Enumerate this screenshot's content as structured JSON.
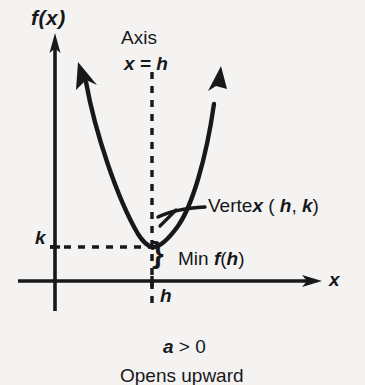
{
  "figure": {
    "title_implicit": "Parabola opening upward with vertex (h, k)",
    "background_color": "#f4f3f1",
    "ink_color": "#17181a",
    "labels": {
      "y_axis": "f(x)",
      "x_axis": "x",
      "axis_of_symmetry": "Axis",
      "axis_equation": "x = h",
      "k_tick": "k",
      "h_tick": "h",
      "vertex": "Vertex ( h, k)",
      "minimum": "Min  f(h)",
      "brace": "}",
      "coefficient_condition": "a > 0",
      "direction": "Opens upward"
    }
  },
  "chart_data": {
    "type": "line",
    "title": "",
    "subtitle": "",
    "xlabel": "x",
    "ylabel": "f(x)",
    "xlim": [
      0,
      1
    ],
    "ylim": [
      0,
      1
    ],
    "grid": false,
    "legend": null,
    "series": [
      {
        "name": "parabola",
        "shape": "upward parabola",
        "vertex": {
          "x": "h",
          "y": "k"
        },
        "opens": "upward",
        "leading_coefficient_sign": "a > 0",
        "left_branch_arrow": true,
        "right_branch_arrow": true
      },
      {
        "name": "axis-of-symmetry",
        "style": "dashed",
        "equation": "x = h",
        "orientation": "vertical"
      },
      {
        "name": "k-level-line",
        "style": "dashed",
        "equation": "f(x) = k",
        "orientation": "horizontal"
      }
    ],
    "annotations": [
      {
        "text": "Axis",
        "points_to": "vertical dashed line"
      },
      {
        "text": "x = h",
        "points_to": "vertical dashed line"
      },
      {
        "text": "Vertex ( h, k)",
        "points_to": "vertex of parabola"
      },
      {
        "text": "Min  f(h)",
        "points_to": "vertical distance from x-axis to vertex"
      },
      {
        "text": "k",
        "points_to": "y-axis tick at vertex height"
      },
      {
        "text": "h",
        "points_to": "x-axis tick below vertex"
      },
      {
        "text": "a > 0",
        "points_to": "caption"
      },
      {
        "text": "Opens upward",
        "points_to": "caption"
      }
    ]
  }
}
